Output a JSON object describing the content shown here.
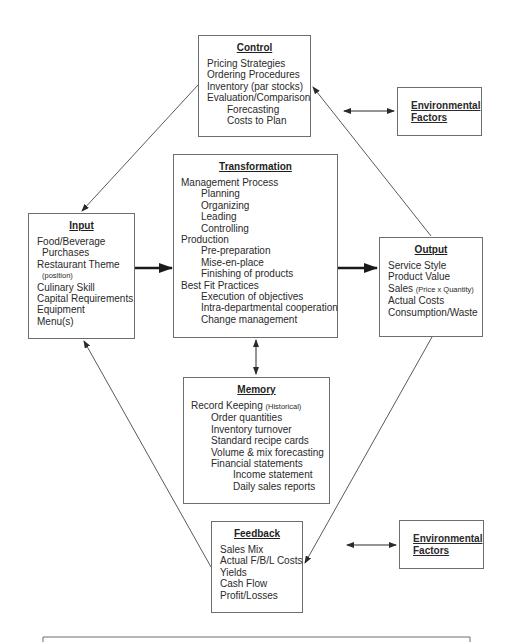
{
  "diagram": {
    "boxes": {
      "control": {
        "title": "Control",
        "items": [
          {
            "text": "Pricing Strategies",
            "indent": 0
          },
          {
            "text": "Ordering Procedures",
            "indent": 0
          },
          {
            "text": "Inventory (par stocks)",
            "indent": 0
          },
          {
            "text": "Evaluation/Comparison",
            "indent": 0
          },
          {
            "text": "Forecasting",
            "indent": 1
          },
          {
            "text": "Costs to Plan",
            "indent": 1
          }
        ]
      },
      "env_top": {
        "line1": "Environmental",
        "line2": "Factors"
      },
      "input": {
        "title": "Input",
        "items": [
          {
            "text": "Food/Beverage",
            "indent": 0
          },
          {
            "text": "Purchases",
            "indent": 0.5
          },
          {
            "text": "Restaurant Theme",
            "indent": 0
          },
          {
            "text": "(position)",
            "indent": 0.5,
            "small": true
          },
          {
            "text": "Culinary Skill",
            "indent": 0
          },
          {
            "text": "Capital Requirements",
            "indent": 0
          },
          {
            "text": "Equipment",
            "indent": 0
          },
          {
            "text": "Menu(s)",
            "indent": 0
          }
        ]
      },
      "transformation": {
        "title": "Transformation",
        "items": [
          {
            "text": "Management Process",
            "indent": 0
          },
          {
            "text": "Planning",
            "indent": 1
          },
          {
            "text": "Organizing",
            "indent": 1
          },
          {
            "text": "Leading",
            "indent": 1
          },
          {
            "text": "Controlling",
            "indent": 1
          },
          {
            "text": "Production",
            "indent": 0
          },
          {
            "text": "Pre-preparation",
            "indent": 1
          },
          {
            "text": "Mise-en-place",
            "indent": 1
          },
          {
            "text": "Finishing of products",
            "indent": 1
          },
          {
            "text": "Best Fit Practices",
            "indent": 0
          },
          {
            "text": "Execution of objectives",
            "indent": 1
          },
          {
            "text": "Intra-departmental cooperation",
            "indent": 1
          },
          {
            "text": "Change management",
            "indent": 1
          }
        ]
      },
      "output": {
        "title": "Output",
        "items": [
          {
            "text": "Service Style"
          },
          {
            "text": "Product Value"
          },
          {
            "text": "Sales",
            "suffix": "(Price x Quantity)"
          },
          {
            "text": "Actual Costs"
          },
          {
            "text": "Consumption/Waste"
          }
        ]
      },
      "memory": {
        "title": "Memory",
        "items": [
          {
            "text": "Record Keeping",
            "suffix": "(Historical)",
            "indent": 0
          },
          {
            "text": "Order quantities",
            "indent": 1
          },
          {
            "text": "Inventory turnover",
            "indent": 1
          },
          {
            "text": "Standard recipe cards",
            "indent": 1
          },
          {
            "text": "Volume & mix forecasting",
            "indent": 1
          },
          {
            "text": "Financial statements",
            "indent": 1
          },
          {
            "text": "Income statement",
            "indent": 2
          },
          {
            "text": "Daily sales reports",
            "indent": 2
          }
        ]
      },
      "feedback": {
        "title": "Feedback",
        "items": [
          {
            "text": "Sales Mix"
          },
          {
            "text": "Actual F/B/L Costs"
          },
          {
            "text": "Yields"
          },
          {
            "text": "Cash Flow"
          },
          {
            "text": "Profit/Losses"
          }
        ]
      },
      "env_bottom": {
        "line1": "Environmental",
        "line2": "Factors"
      }
    },
    "colors": {
      "line": "#5a5a5a",
      "border": "#6e6e6e",
      "text": "#2a2a2a"
    }
  }
}
